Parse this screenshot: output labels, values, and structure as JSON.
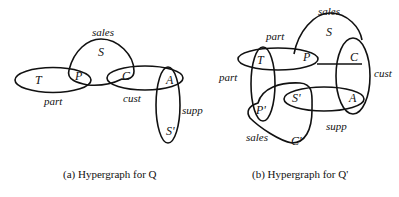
{
  "figures": [
    {
      "id": "a",
      "caption": "(a) Hypergraph for Q",
      "nodes": [
        {
          "label": "T",
          "x": 35,
          "y": 84
        },
        {
          "label": "P",
          "x": 75,
          "y": 80
        },
        {
          "label": "S",
          "x": 98,
          "y": 56
        },
        {
          "label": "C",
          "x": 122,
          "y": 80
        },
        {
          "label": "A",
          "x": 166,
          "y": 84
        },
        {
          "label": "S'",
          "x": 166,
          "y": 135
        }
      ],
      "edge_labels": [
        {
          "label": "sales",
          "x": 92,
          "y": 36
        },
        {
          "label": "part",
          "x": 44,
          "y": 105
        },
        {
          "label": "cust",
          "x": 123,
          "y": 102
        },
        {
          "label": "supp",
          "x": 182,
          "y": 114
        }
      ]
    },
    {
      "id": "b",
      "caption": "(b) Hypergraph for Q'",
      "nodes": [
        {
          "label": "T",
          "x": 257,
          "y": 64
        },
        {
          "label": "P",
          "x": 303,
          "y": 61
        },
        {
          "label": "S",
          "x": 326,
          "y": 36
        },
        {
          "label": "C",
          "x": 350,
          "y": 61
        },
        {
          "label": "S'",
          "x": 292,
          "y": 102
        },
        {
          "label": "A",
          "x": 349,
          "y": 102
        },
        {
          "label": "P'",
          "x": 256,
          "y": 114
        },
        {
          "label": "C'",
          "x": 291,
          "y": 145
        }
      ],
      "edge_labels": [
        {
          "label": "sales",
          "x": 318,
          "y": 15
        },
        {
          "label": "part",
          "x": 266,
          "y": 40
        },
        {
          "label": "part",
          "x": 219,
          "y": 81
        },
        {
          "label": "cust",
          "x": 374,
          "y": 77
        },
        {
          "label": "supp",
          "x": 326,
          "y": 130
        },
        {
          "label": "sales",
          "x": 246,
          "y": 141
        }
      ]
    }
  ]
}
